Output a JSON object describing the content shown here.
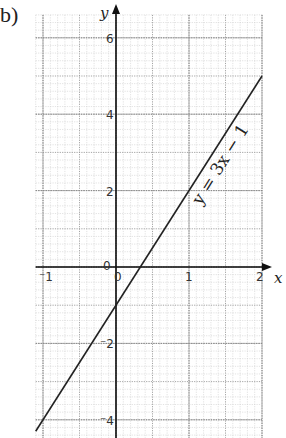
{
  "part_label": "b)",
  "chart_data": {
    "type": "line",
    "title": "",
    "xlabel": "x",
    "ylabel": "y",
    "xlim": [
      -1,
      2
    ],
    "ylim": [
      -4.3,
      6.6
    ],
    "x_ticks": [
      -1,
      0,
      1,
      2
    ],
    "x_tick_labels": [
      "-1",
      "0",
      "1",
      "2"
    ],
    "y_ticks": [
      -4,
      -2,
      0,
      2,
      4,
      6
    ],
    "y_tick_labels": [
      "-4",
      "-2",
      "0",
      "2",
      "4",
      "6"
    ],
    "grid": true,
    "series": [
      {
        "name": "y = 3x − 1",
        "equation": "y = 3x − 1",
        "slope": 3,
        "intercept": -1,
        "x": [
          -1.1,
          2
        ],
        "y": [
          -4.3,
          5
        ]
      }
    ],
    "annotations": [
      "y = 3x − 1"
    ]
  }
}
